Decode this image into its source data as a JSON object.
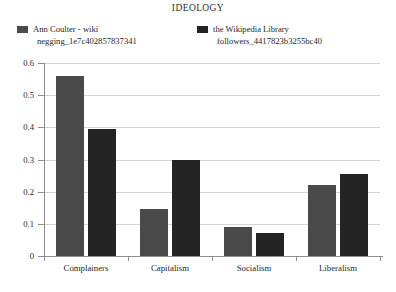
{
  "chart_data": {
    "type": "bar",
    "title": "IDEOLOGY",
    "xlabel": "",
    "ylabel": "",
    "categories": [
      "Complainers",
      "Capitalism",
      "Socialism",
      "Liberalism"
    ],
    "series": [
      {
        "name": "Ann Coulter - wiki negging_1e7c402857837341",
        "name_line1": "Ann Coulter - wiki",
        "name_line2": "negging_1e7c402857837341",
        "color": "#4a4a4a",
        "values": [
          0.56,
          0.147,
          0.09,
          0.222
        ]
      },
      {
        "name": "the Wikipedia Library followers_4417823b3255bc40",
        "name_line1": "the Wikipedia Library",
        "name_line2": "followers_4417823b3255bc40",
        "color": "#232323",
        "values": [
          0.395,
          0.3,
          0.07,
          0.255
        ]
      }
    ],
    "ylim": [
      0,
      0.6
    ],
    "yticks": [
      "0",
      "0.1",
      "0.2",
      "0.3",
      "0.4",
      "0.5",
      "0.6"
    ],
    "ytick_values": [
      0,
      0.1,
      0.2,
      0.3,
      0.4,
      0.5,
      0.6
    ],
    "grid": true,
    "legend_position": "top"
  },
  "colors": {
    "series_1": "#4a4a4a",
    "series_2": "#232323",
    "axis": "#8d8d8d",
    "grid": "#d2d2d2",
    "background": "#ffffff",
    "text": "#1f1f1f"
  }
}
